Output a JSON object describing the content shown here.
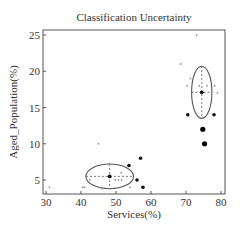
{
  "chart_data": {
    "type": "scatter",
    "title": "Classification Uncertainty",
    "xlabel": "Services(%)",
    "ylabel": "Aged_Population(%)",
    "xlim": [
      29,
      81
    ],
    "ylim": [
      3,
      26
    ],
    "xticks": [
      30,
      40,
      50,
      60,
      70,
      80
    ],
    "yticks": [
      5,
      10,
      15,
      20,
      25
    ],
    "grid": false,
    "legend": null,
    "series": [
      {
        "name": "low-uncertainty points",
        "marker": "small-gray",
        "points": [
          [
            73,
            25
          ],
          [
            68.5,
            21
          ],
          [
            71.3,
            19
          ],
          [
            70.3,
            18
          ],
          [
            73.8,
            18
          ],
          [
            76,
            18
          ],
          [
            78.2,
            18
          ],
          [
            79,
            17
          ],
          [
            45,
            10
          ],
          [
            31,
            4
          ],
          [
            40.5,
            4
          ],
          [
            41,
            4
          ],
          [
            42.2,
            6.2
          ],
          [
            42.5,
            5
          ],
          [
            51.5,
            6
          ],
          [
            49.8,
            5
          ],
          [
            50.7,
            5
          ],
          [
            51.6,
            5
          ],
          [
            54,
            4
          ],
          [
            46,
            3.8
          ]
        ]
      },
      {
        "name": "uncertain points",
        "marker": "filled-black-medium",
        "points": [
          [
            70.5,
            14
          ],
          [
            78,
            14
          ],
          [
            53.7,
            7
          ],
          [
            57,
            8
          ],
          [
            56,
            5
          ],
          [
            57.7,
            4
          ]
        ]
      },
      {
        "name": "highly uncertain points",
        "marker": "filled-black-large",
        "points": [
          [
            74.8,
            12
          ],
          [
            75.3,
            10
          ]
        ]
      },
      {
        "name": "cluster centers",
        "marker": "filled-black-center",
        "points": [
          [
            74.5,
            17.1
          ],
          [
            48.2,
            5.5
          ]
        ]
      }
    ],
    "ellipses": [
      {
        "center": [
          74.5,
          17.1
        ],
        "rx": 2.9,
        "ry": 3.6,
        "crosshair": "dashed"
      },
      {
        "center": [
          48.2,
          5.5
        ],
        "rx": 6.8,
        "ry": 1.7,
        "crosshair": "dashed"
      }
    ]
  }
}
